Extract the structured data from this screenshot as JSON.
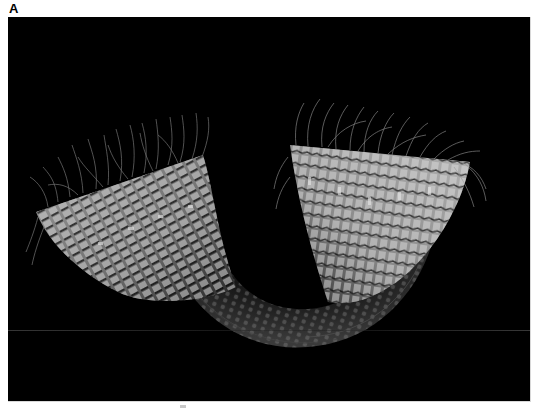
{
  "figure": {
    "panel_label": "A",
    "background_color": "#000000",
    "structure_color": "#b8b8b8",
    "fiber_color": "#8a8a8a"
  }
}
